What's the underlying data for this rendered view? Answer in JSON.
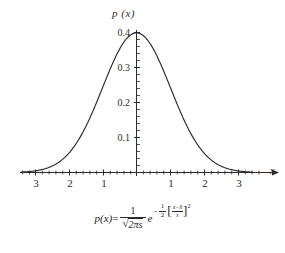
{
  "figure": {
    "background_color": "#ffffff",
    "curve_color": "#2b2b2b",
    "axis_color": "#2b2b2b"
  },
  "chart_data": {
    "type": "line",
    "title": "",
    "subtitle": "",
    "xlabel": "x",
    "ylabel": "p (x)",
    "grid": false,
    "legend": "none",
    "xlim": [
      -3.4,
      3.4
    ],
    "ylim": [
      0,
      0.42
    ],
    "xticks": [
      -3,
      -2,
      -1,
      1,
      2,
      3
    ],
    "xtick_labels": [
      "3",
      "2",
      "1",
      "1",
      "2",
      "3"
    ],
    "yticks": [
      0.1,
      0.2,
      0.3,
      0.4
    ],
    "ytick_labels": [
      "0.1",
      "0.2",
      "0.3",
      "0.4"
    ],
    "minor_tick_step": 0.2,
    "series": [
      {
        "name": "standard normal density",
        "mean": 0,
        "std": 1,
        "peak_value": 0.3989,
        "x": [
          -3.4,
          -3.2,
          -3.0,
          -2.8,
          -2.6,
          -2.4,
          -2.2,
          -2.0,
          -1.8,
          -1.6,
          -1.4,
          -1.2,
          -1.0,
          -0.8,
          -0.6,
          -0.4,
          -0.2,
          0.0,
          0.2,
          0.4,
          0.6,
          0.8,
          1.0,
          1.2,
          1.4,
          1.6,
          1.8,
          2.0,
          2.2,
          2.4,
          2.6,
          2.8,
          3.0,
          3.2,
          3.4
        ],
        "y": [
          0.0012,
          0.0024,
          0.0044,
          0.0079,
          0.0136,
          0.0224,
          0.0355,
          0.054,
          0.079,
          0.1109,
          0.1497,
          0.1942,
          0.242,
          0.2897,
          0.3332,
          0.3683,
          0.391,
          0.3989,
          0.391,
          0.3683,
          0.3332,
          0.2897,
          0.242,
          0.1942,
          0.1497,
          0.1109,
          0.079,
          0.054,
          0.0355,
          0.0224,
          0.0136,
          0.0079,
          0.0044,
          0.0024,
          0.0012
        ]
      }
    ]
  },
  "axis_titles": {
    "y": "p (x)",
    "x": "x"
  },
  "formula": {
    "lhs": "p(x)",
    "equals": "=",
    "coefficient_numerator": "1",
    "coefficient_denominator_radicand": "2πs",
    "base": "e",
    "exponent_sign": "−",
    "exponent_fraction_numerator": "1",
    "exponent_fraction_denominator": "2",
    "bracket_open": "[",
    "bracket_close": "]",
    "inner_numerator": "x−x̄",
    "inner_denominator": "s",
    "exponent_power": "2",
    "plain_text": "p(x) = 1/√(2πs) e^{-(1/2)[(x-x̄)/s]^2}"
  }
}
